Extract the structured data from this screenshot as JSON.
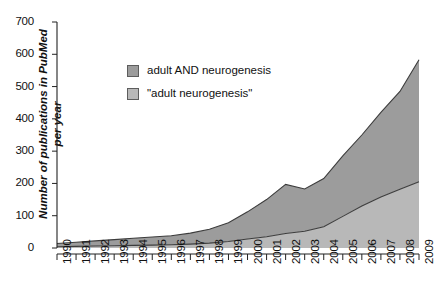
{
  "chart_data": {
    "type": "area",
    "title": "",
    "subtitle": "",
    "xlabel": "",
    "ylabel": "Number of publications in PubMed per year",
    "ylabel_line1": "Number of publications in PubMed",
    "ylabel_line2": "per year",
    "stacked": true,
    "grid": false,
    "legend_position": "inside-top-left",
    "xlim": [
      1990,
      2009
    ],
    "ylim": [
      0,
      700
    ],
    "ytick_step": 100,
    "yticks": [
      0,
      100,
      200,
      300,
      400,
      500,
      600,
      700
    ],
    "ytick_labels": [
      "0",
      "100",
      "200",
      "300",
      "400",
      "500",
      "600",
      "700"
    ],
    "categories": [
      1990,
      1991,
      1992,
      1993,
      1994,
      1995,
      1996,
      1997,
      1998,
      1999,
      2000,
      2001,
      2002,
      2003,
      2004,
      2005,
      2006,
      2007,
      2008,
      2009
    ],
    "xtick_labels": [
      "1990",
      "1991",
      "1992",
      "1993",
      "1994",
      "1995",
      "1996",
      "1997",
      "1998",
      "1999",
      "2000",
      "2001",
      "2002",
      "2003",
      "2004",
      "2005",
      "2006",
      "2007",
      "2008",
      "2009"
    ],
    "series": [
      {
        "name": "adult AND neurogenesis",
        "color": "#9c9c9c",
        "values": [
          14,
          18,
          22,
          26,
          30,
          34,
          38,
          46,
          58,
          78,
          112,
          150,
          197,
          183,
          215,
          285,
          350,
          420,
          485,
          583
        ]
      },
      {
        "name": "\"adult neurogenesis\"",
        "color": "#b8b8b8",
        "values": [
          4,
          5,
          6,
          7,
          8,
          9,
          10,
          12,
          15,
          20,
          28,
          35,
          45,
          52,
          66,
          98,
          130,
          158,
          182,
          205
        ]
      }
    ]
  },
  "legend": {
    "items": [
      {
        "label": "adult AND neurogenesis",
        "color": "#9c9c9c"
      },
      {
        "label": "\"adult neurogenesis\"",
        "color": "#b8b8b8"
      }
    ]
  },
  "colors": {
    "upper_band": "#9c9c9c",
    "lower_band": "#b8b8b8",
    "line": "#3c3c3c",
    "axis": "#222222",
    "background": "#ffffff"
  }
}
